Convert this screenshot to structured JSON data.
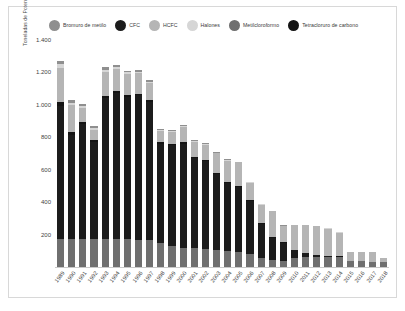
{
  "chart_data": {
    "type": "bar",
    "stacked": true,
    "title": "",
    "xlabel": "",
    "ylabel": "Toneladas de Potencial de Agotamiento de Ozono (PAO)",
    "ylim": [
      0,
      1400
    ],
    "yticks": [
      200,
      400,
      600,
      800,
      1000,
      1200,
      1400
    ],
    "ytick_labels": [
      "200",
      "400",
      "600",
      "800",
      "1.000",
      "1.200",
      "1.400"
    ],
    "grid": false,
    "legend_position": "top",
    "categories": [
      "1989",
      "1990",
      "1991",
      "1992",
      "1993",
      "1994",
      "1995",
      "1996",
      "1997",
      "1998",
      "1999",
      "2000",
      "2001",
      "2002",
      "2003",
      "2004",
      "2005",
      "2006",
      "2007",
      "2008",
      "2009",
      "2010",
      "2011",
      "2012",
      "2013",
      "2014",
      "2015",
      "2016",
      "2017",
      "2018"
    ],
    "series": [
      {
        "name": "Metilcloroformo",
        "color": "#6f6f6f",
        "values": [
          175,
          175,
          172,
          170,
          175,
          172,
          170,
          168,
          165,
          150,
          130,
          120,
          118,
          112,
          105,
          100,
          95,
          80,
          55,
          45,
          40,
          55,
          60,
          62,
          62,
          60,
          40,
          35,
          30,
          28
        ]
      },
      {
        "name": "CFC",
        "color": "#1c1c1c",
        "values": [
          820,
          640,
          710,
          600,
          865,
          900,
          880,
          890,
          855,
          610,
          620,
          640,
          555,
          540,
          470,
          420,
          400,
          330,
          210,
          135,
          110,
          50,
          25,
          12,
          6,
          4,
          0,
          0,
          0,
          0
        ]
      },
      {
        "name": "Tetracloruro de carbono",
        "color": "#141414",
        "values": [
          20,
          15,
          15,
          12,
          15,
          14,
          12,
          12,
          10,
          10,
          10,
          10,
          8,
          8,
          6,
          6,
          5,
          5,
          4,
          3,
          3,
          2,
          2,
          1,
          1,
          1,
          0,
          0,
          0,
          0
        ]
      },
      {
        "name": "HCFC",
        "color": "#b5b5b5",
        "values": [
          215,
          170,
          85,
          65,
          150,
          135,
          130,
          125,
          105,
          70,
          75,
          95,
          90,
          95,
          120,
          130,
          145,
          105,
          115,
          160,
          100,
          150,
          170,
          175,
          168,
          148,
          55,
          60,
          62,
          28
        ]
      },
      {
        "name": "Halones",
        "color": "#d6d6d6",
        "values": [
          20,
          14,
          12,
          10,
          12,
          12,
          10,
          10,
          8,
          6,
          6,
          6,
          5,
          5,
          4,
          4,
          3,
          3,
          2,
          2,
          2,
          1,
          1,
          1,
          1,
          1,
          0,
          0,
          0,
          0
        ]
      },
      {
        "name": "Bromuro de metilo",
        "color": "#8f8f8f",
        "values": [
          22,
          14,
          12,
          10,
          14,
          12,
          10,
          10,
          8,
          6,
          6,
          6,
          5,
          5,
          4,
          4,
          3,
          3,
          2,
          2,
          2,
          1,
          1,
          1,
          1,
          1,
          0,
          0,
          0,
          0
        ]
      }
    ]
  },
  "legend": {
    "items": [
      {
        "label": "Bromuro de metilo",
        "color": "#8f8f8f"
      },
      {
        "label": "CFC",
        "color": "#1c1c1c"
      },
      {
        "label": "HCFC",
        "color": "#b5b5b5"
      },
      {
        "label": "Halones",
        "color": "#d6d6d6"
      },
      {
        "label": "Metilcloroformo",
        "color": "#6f6f6f"
      },
      {
        "label": "Tetracloruro de carbono",
        "color": "#141414"
      }
    ]
  }
}
